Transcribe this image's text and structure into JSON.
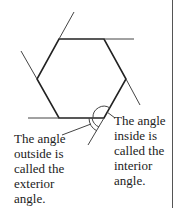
{
  "diagram": {
    "shape": "regular hexagon",
    "colors": {
      "stroke": "#222222",
      "extension_stroke": "#444444",
      "background": "#ffffff"
    },
    "labels": {
      "exterior": "The angle\noutside is\ncalled the\nexterior\nangle.",
      "interior": "The angle\ninside is\ncalled the\ninterior\nangle."
    }
  }
}
